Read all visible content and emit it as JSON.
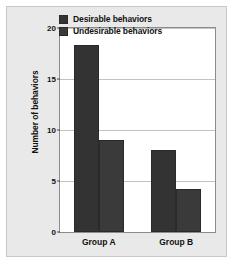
{
  "chart_data": {
    "type": "bar",
    "title": "",
    "xlabel": "",
    "ylabel": "Number of behaviors",
    "categories": [
      "Group A",
      "Group B"
    ],
    "series": [
      {
        "name": "Desirable behaviors",
        "values": [
          18.3,
          8.0
        ],
        "color": "#333333"
      },
      {
        "name": "Undesirable behaviors",
        "values": [
          9.0,
          4.2
        ],
        "color": "#3a3a3a"
      }
    ],
    "ylim": [
      0,
      20
    ],
    "yticks": [
      0,
      5,
      10,
      15,
      20
    ],
    "ytick_labels": [
      "0",
      "5",
      "10",
      "15",
      "20"
    ],
    "grid": true,
    "legend_position": "top-right-inside",
    "background_color": "#e9e9e9",
    "plot_background_color": "#ffffff",
    "gridline_color": "#c2c2c2",
    "axis_color": "#8c8c8c"
  }
}
